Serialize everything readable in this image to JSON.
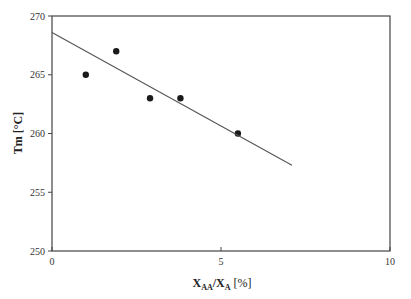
{
  "chart_data": {
    "type": "scatter",
    "title": "",
    "xlabel": "X_AA/X_A [%]",
    "ylabel": "Tm [°C]",
    "xlim": [
      0,
      10
    ],
    "ylim": [
      250,
      270
    ],
    "x_ticks": [
      "0",
      "5",
      "10"
    ],
    "y_ticks": [
      "250",
      "255",
      "260",
      "265",
      "270"
    ],
    "grid": false,
    "legend": null,
    "series": [
      {
        "name": "data",
        "type": "scatter",
        "x": [
          1.0,
          1.9,
          2.9,
          3.8,
          5.5
        ],
        "y": [
          265,
          267,
          263,
          263,
          260
        ]
      },
      {
        "name": "linear fit",
        "type": "line",
        "x": [
          0,
          7.1
        ],
        "y": [
          268.6,
          257.3
        ]
      }
    ]
  },
  "axes": {
    "x_title_main": "X",
    "x_title_sub1": "AA",
    "x_title_mid": "/X",
    "x_title_sub2": "A",
    "x_title_unit": " [%]",
    "y_title": "Tm  [°C]"
  }
}
